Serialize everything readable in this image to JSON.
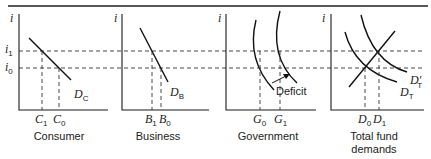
{
  "figure": {
    "y_axis_symbol": "i",
    "y_ticks": [
      {
        "base": "i",
        "sub": "1"
      },
      {
        "base": "i",
        "sub": "0"
      }
    ],
    "panels": [
      {
        "title": "Consumer",
        "curve": {
          "base": "D",
          "sub": "C"
        },
        "x_ticks": [
          {
            "base": "C",
            "sub": "1"
          },
          {
            "base": "C",
            "sub": "0"
          }
        ]
      },
      {
        "title": "Business",
        "curve": {
          "base": "D",
          "sub": "B"
        },
        "x_ticks": [
          {
            "base": "B",
            "sub": "1"
          },
          {
            "base": "B",
            "sub": "0"
          }
        ]
      },
      {
        "title": "Government",
        "annotation": "Deficit",
        "x_ticks": [
          {
            "base": "G",
            "sub": "0"
          },
          {
            "base": "G",
            "sub": "1"
          }
        ]
      },
      {
        "title_line1": "Total fund",
        "title_line2": "demands",
        "curves": [
          {
            "base": "D",
            "sub": "T"
          },
          {
            "base": "D",
            "sub": "T",
            "prime": "′"
          }
        ],
        "x_ticks": [
          {
            "base": "D",
            "sub": "0"
          },
          {
            "base": "D",
            "sub": "1"
          }
        ]
      }
    ]
  }
}
